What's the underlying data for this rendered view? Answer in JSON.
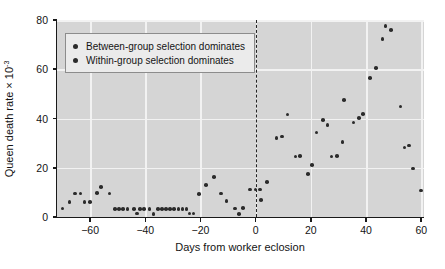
{
  "chart_data": {
    "type": "scatter",
    "title": "",
    "xlabel": "Days from worker eclosion",
    "ylabel": "Queen death rate × 10",
    "ylabel_exponent": "-3",
    "xlim": [
      -72,
      61
    ],
    "ylim": [
      0,
      80
    ],
    "xticks": [
      -60,
      -40,
      -20,
      0,
      20,
      40,
      60
    ],
    "xticklabels": [
      "−60",
      "−40",
      "−20",
      "0",
      "20",
      "40",
      "60"
    ],
    "yticks": [
      0,
      20,
      40,
      60,
      80
    ],
    "yticklabels": [
      "0",
      "20",
      "40",
      "60",
      "80"
    ],
    "grid": true,
    "grid_color": "#f2f2f2",
    "plot_bgcolor": "#d5d5d5",
    "marker_color": "#2b2b2b",
    "reference_line": {
      "x": 0,
      "style": "dashed",
      "color": "#242424"
    },
    "legend": {
      "position": "upper-left",
      "entries": [
        {
          "marker": "circle",
          "color": "#2b2b2b",
          "label": "Between-group selection dominates"
        },
        {
          "marker": "circle",
          "color": "#2b2b2b",
          "label": "Within-group selection dominates"
        }
      ]
    },
    "points": [
      {
        "x": -70.0,
        "y": 3.4
      },
      {
        "x": -67.5,
        "y": 6.2
      },
      {
        "x": -65.5,
        "y": 9.6
      },
      {
        "x": -63.5,
        "y": 9.6
      },
      {
        "x": -62.0,
        "y": 6.1
      },
      {
        "x": -60.0,
        "y": 6.1
      },
      {
        "x": -57.5,
        "y": 9.7
      },
      {
        "x": -56.0,
        "y": 12.3
      },
      {
        "x": -53.0,
        "y": 9.6
      },
      {
        "x": -51.0,
        "y": 3.3
      },
      {
        "x": -49.5,
        "y": 3.3
      },
      {
        "x": -48.0,
        "y": 3.3
      },
      {
        "x": -46.5,
        "y": 3.3
      },
      {
        "x": -44.0,
        "y": 3.3
      },
      {
        "x": -43.0,
        "y": 1.4
      },
      {
        "x": -42.0,
        "y": 3.3
      },
      {
        "x": -40.5,
        "y": 3.3
      },
      {
        "x": -38.5,
        "y": 3.3
      },
      {
        "x": -37.0,
        "y": 1.3
      },
      {
        "x": -35.5,
        "y": 3.3
      },
      {
        "x": -34.0,
        "y": 3.3
      },
      {
        "x": -32.5,
        "y": 3.3
      },
      {
        "x": -31.0,
        "y": 3.3
      },
      {
        "x": -29.5,
        "y": 3.3
      },
      {
        "x": -28.0,
        "y": 3.3
      },
      {
        "x": -26.5,
        "y": 3.3
      },
      {
        "x": -25.0,
        "y": 3.3
      },
      {
        "x": -24.0,
        "y": 1.4
      },
      {
        "x": -22.5,
        "y": 1.4
      },
      {
        "x": -20.5,
        "y": 9.4
      },
      {
        "x": -18.0,
        "y": 13.0
      },
      {
        "x": -15.0,
        "y": 16.3
      },
      {
        "x": -12.5,
        "y": 9.6
      },
      {
        "x": -10.5,
        "y": 6.5
      },
      {
        "x": -7.5,
        "y": 3.4
      },
      {
        "x": -6.0,
        "y": 1.3
      },
      {
        "x": -4.5,
        "y": 3.6
      },
      {
        "x": -2.0,
        "y": 11.1
      },
      {
        "x": 0.0,
        "y": 11.1
      },
      {
        "x": 1.5,
        "y": 11.1
      },
      {
        "x": 2.0,
        "y": 7.0
      },
      {
        "x": 4.0,
        "y": 14.2
      },
      {
        "x": 7.5,
        "y": 32.0
      },
      {
        "x": 9.5,
        "y": 32.7
      },
      {
        "x": 11.5,
        "y": 41.6
      },
      {
        "x": 14.5,
        "y": 24.5
      },
      {
        "x": 16.0,
        "y": 24.7
      },
      {
        "x": 19.0,
        "y": 17.5
      },
      {
        "x": 20.5,
        "y": 21.2
      },
      {
        "x": 22.0,
        "y": 34.3
      },
      {
        "x": 24.5,
        "y": 39.3
      },
      {
        "x": 26.0,
        "y": 37.3
      },
      {
        "x": 27.5,
        "y": 24.5
      },
      {
        "x": 29.5,
        "y": 24.7
      },
      {
        "x": 31.5,
        "y": 30.5
      },
      {
        "x": 32.0,
        "y": 47.4
      },
      {
        "x": 35.5,
        "y": 38.3
      },
      {
        "x": 37.5,
        "y": 40.3
      },
      {
        "x": 39.0,
        "y": 41.8
      },
      {
        "x": 41.5,
        "y": 56.4
      },
      {
        "x": 43.5,
        "y": 60.4
      },
      {
        "x": 46.0,
        "y": 72.3
      },
      {
        "x": 47.0,
        "y": 77.6
      },
      {
        "x": 49.0,
        "y": 76.0
      },
      {
        "x": 52.5,
        "y": 44.8
      },
      {
        "x": 54.0,
        "y": 28.3
      },
      {
        "x": 55.5,
        "y": 29.0
      },
      {
        "x": 57.0,
        "y": 19.7
      },
      {
        "x": 60.0,
        "y": 10.8
      }
    ]
  }
}
